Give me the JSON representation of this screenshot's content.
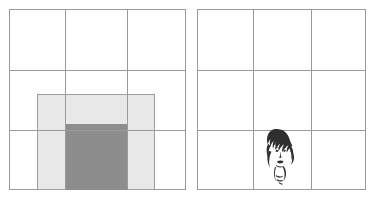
{
  "figure": {
    "background_color": "#ffffff",
    "width": 377,
    "height": 201,
    "panel_count": 2
  },
  "panels": [
    {
      "id": "left-panel",
      "name": "shaded-region-panel",
      "x": 9,
      "y": 9,
      "width": 177,
      "height": 181,
      "border_color": "#9a9a9a",
      "grid": {
        "columns": 3,
        "rows": 3,
        "vertical_line_x": [
          56,
          118
        ],
        "horizontal_line_y": [
          61,
          121
        ],
        "color": "#9a9a9a"
      },
      "shapes": [
        {
          "id": "outer-light-rect",
          "name": "light-gray-rectangle",
          "fill": "#e8e8e8",
          "stroke": "#9d9d9d",
          "x": 28,
          "y": 85,
          "width": 118,
          "height": 96
        },
        {
          "id": "inner-dark-rect",
          "name": "dark-gray-rectangle",
          "fill": "#8d8d8d",
          "stroke": "#8d8d8d",
          "x": 56,
          "y": 115,
          "width": 62,
          "height": 66
        }
      ]
    },
    {
      "id": "right-panel",
      "name": "face-sketch-panel",
      "x": 197,
      "y": 9,
      "width": 169,
      "height": 181,
      "border_color": "#9a9a9a",
      "grid": {
        "columns": 3,
        "rows": 3,
        "vertical_line_x": [
          56,
          114
        ],
        "horizontal_line_y": [
          61,
          121
        ],
        "color": "#9a9a9a"
      },
      "shapes": [
        {
          "id": "face-sketch",
          "name": "womans-face-ink-sketch",
          "fill": "#2b2b2b",
          "x": 62,
          "y": 118,
          "width": 38,
          "height": 58
        }
      ]
    }
  ]
}
